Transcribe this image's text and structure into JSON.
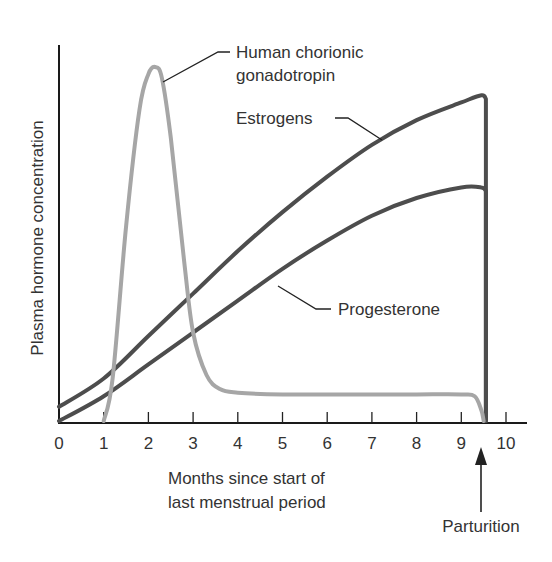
{
  "chart_data": {
    "type": "line",
    "title": "",
    "xlabel": "Months since start of last menstrual period",
    "xlabel_lines": [
      "Months since start of",
      "last menstrual period"
    ],
    "ylabel": "Plasma hormone concentration",
    "xlim": [
      0,
      10.4
    ],
    "ylim": [
      0,
      1
    ],
    "x_ticks": [
      "0",
      "1",
      "2",
      "3",
      "4",
      "5",
      "6",
      "7",
      "8",
      "9",
      "10"
    ],
    "grid": false,
    "legend": "inline-callouts",
    "series": [
      {
        "name": "Human chorionic gonadotropin",
        "label_lines": [
          "Human chorionic",
          "gonadotropin"
        ],
        "color": "#a6a6a6",
        "x": [
          1.0,
          1.2,
          1.5,
          1.8,
          2.0,
          2.15,
          2.3,
          2.5,
          2.8,
          3.0,
          3.3,
          3.6,
          4.0,
          5.0,
          6.0,
          7.0,
          8.0,
          9.0,
          9.3,
          9.45,
          9.5
        ],
        "y": [
          0.0,
          0.12,
          0.55,
          0.88,
          0.98,
          1.0,
          0.97,
          0.8,
          0.45,
          0.25,
          0.13,
          0.09,
          0.08,
          0.075,
          0.075,
          0.075,
          0.075,
          0.075,
          0.07,
          0.03,
          0.0
        ]
      },
      {
        "name": "Estrogens",
        "label_lines": [
          "Estrogens"
        ],
        "color": "#4d4d4d",
        "x": [
          0,
          1,
          2,
          3,
          4,
          5,
          6,
          7,
          8,
          9,
          9.45,
          9.55,
          9.55
        ],
        "y": [
          0.04,
          0.12,
          0.24,
          0.36,
          0.48,
          0.59,
          0.69,
          0.78,
          0.85,
          0.9,
          0.92,
          0.91,
          0.0
        ]
      },
      {
        "name": "Progesterone",
        "label_lines": [
          "Progesterone"
        ],
        "color": "#4d4d4d",
        "x": [
          0,
          1,
          2,
          3,
          4,
          5,
          6,
          7,
          8,
          9,
          9.45,
          9.55,
          9.55
        ],
        "y": [
          0.0,
          0.07,
          0.16,
          0.25,
          0.34,
          0.43,
          0.51,
          0.58,
          0.63,
          0.66,
          0.66,
          0.65,
          0.0
        ]
      }
    ],
    "annotations": [
      {
        "text": "Parturition",
        "x": 9.5,
        "type": "arrow-up"
      }
    ]
  }
}
